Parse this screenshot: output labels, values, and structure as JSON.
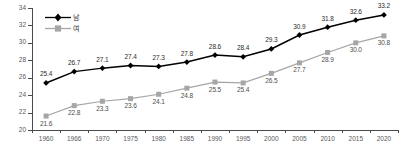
{
  "chart_data": {
    "type": "line",
    "title": "",
    "xlabel": "",
    "ylabel": "",
    "ylim": [
      20,
      34
    ],
    "ytick_step": 2,
    "yticks": [
      20,
      22,
      24,
      26,
      28,
      30,
      32,
      34
    ],
    "grid": false,
    "legend_position": "top-left",
    "categories": [
      "1960",
      "1966",
      "1970",
      "1975",
      "1980",
      "1985",
      "1990",
      "1995",
      "2000",
      "2005",
      "2010",
      "2015",
      "2020"
    ],
    "series": [
      {
        "name": "남",
        "color": "#000000",
        "marker": "diamond",
        "values": [
          25.4,
          26.7,
          27.1,
          27.4,
          27.3,
          27.8,
          28.6,
          28.4,
          29.3,
          30.9,
          31.8,
          32.6,
          33.2
        ]
      },
      {
        "name": "여",
        "color": "#a6a6a6",
        "marker": "square",
        "values": [
          21.6,
          22.8,
          23.3,
          23.6,
          24.1,
          24.8,
          25.5,
          25.4,
          26.5,
          27.7,
          28.9,
          30.0,
          30.8
        ]
      }
    ]
  },
  "legend": {
    "items": [
      {
        "label": "남",
        "icon": "black-diamond-line-marker"
      },
      {
        "label": "여",
        "icon": "gray-square-line-marker"
      }
    ]
  },
  "axis": {
    "y_tick_labels": [
      "34",
      "32",
      "30",
      "28",
      "26",
      "24",
      "22",
      "20"
    ],
    "x_tick_labels": [
      "1960",
      "1966",
      "1970",
      "1975",
      "1980",
      "1985",
      "1990",
      "1995",
      "2000",
      "2005",
      "2010",
      "2015",
      "2020"
    ]
  }
}
